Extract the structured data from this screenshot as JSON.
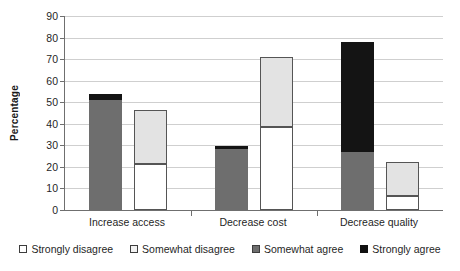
{
  "chart_data": {
    "type": "bar",
    "title": "",
    "xlabel": "",
    "ylabel": "Percentage",
    "ylim": [
      0,
      90
    ],
    "ytick_step": 10,
    "yticks": [
      0,
      10,
      20,
      30,
      40,
      50,
      60,
      70,
      80,
      90
    ],
    "grid": true,
    "stacked": true,
    "legend_position": "bottom",
    "categories": [
      "Increase access",
      "Decrease cost",
      "Decrease quality"
    ],
    "series": [
      {
        "name": "Strongly disagree",
        "color": "#ffffff",
        "values": [
          21.5,
          38.5,
          6.5
        ]
      },
      {
        "name": "Somewhat disagree",
        "color": "#e3e3e3",
        "values": [
          25.0,
          32.5,
          16.0
        ]
      },
      {
        "name": "Somewhat agree",
        "color": "#6e6e6e",
        "values": [
          51.0,
          28.5,
          27.0
        ]
      },
      {
        "name": "Strongly agree",
        "color": "#141414",
        "values": [
          3.0,
          1.0,
          51.0
        ]
      }
    ],
    "bars": [
      {
        "category": "Increase access",
        "bar": "agree",
        "segments": [
          {
            "series": "Somewhat agree",
            "start": 0,
            "end": 51.0
          },
          {
            "series": "Strongly agree",
            "start": 51.0,
            "end": 54.0
          }
        ],
        "total": 54.0
      },
      {
        "category": "Increase access",
        "bar": "disagree",
        "segments": [
          {
            "series": "Strongly disagree",
            "start": 0,
            "end": 21.5
          },
          {
            "series": "Somewhat disagree",
            "start": 21.5,
            "end": 46.5
          }
        ],
        "total": 46.5
      },
      {
        "category": "Decrease cost",
        "bar": "agree",
        "segments": [
          {
            "series": "Somewhat agree",
            "start": 0,
            "end": 28.5
          },
          {
            "series": "Strongly agree",
            "start": 28.5,
            "end": 29.5
          }
        ],
        "total": 29.5
      },
      {
        "category": "Decrease cost",
        "bar": "disagree",
        "segments": [
          {
            "series": "Strongly disagree",
            "start": 0,
            "end": 38.5
          },
          {
            "series": "Somewhat disagree",
            "start": 38.5,
            "end": 71.0
          }
        ],
        "total": 71.0
      },
      {
        "category": "Decrease quality",
        "bar": "agree",
        "segments": [
          {
            "series": "Somewhat agree",
            "start": 0,
            "end": 27.0
          },
          {
            "series": "Strongly agree",
            "start": 27.0,
            "end": 78.0
          }
        ],
        "total": 78.0
      },
      {
        "category": "Decrease quality",
        "bar": "disagree",
        "segments": [
          {
            "series": "Strongly disagree",
            "start": 0,
            "end": 6.5
          },
          {
            "series": "Somewhat disagree",
            "start": 6.5,
            "end": 22.5
          }
        ],
        "total": 22.5
      }
    ]
  },
  "axis": {
    "y_title": "Percentage"
  },
  "legend": {
    "items": [
      {
        "label": "Strongly disagree",
        "key": "strongly-disagree"
      },
      {
        "label": "Somewhat disagree",
        "key": "somewhat-disagree"
      },
      {
        "label": "Somewhat agree",
        "key": "somewhat-agree"
      },
      {
        "label": "Strongly agree",
        "key": "strongly-agree"
      }
    ]
  }
}
